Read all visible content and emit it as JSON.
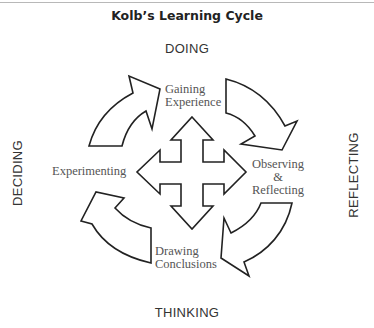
{
  "title": "Kolb’s Learning Cycle",
  "axes": {
    "top": "DOING",
    "right": "REFLECTING",
    "bottom": "THINKING",
    "left": "DECIDING"
  },
  "stages": [
    {
      "id": "gaining",
      "lines": [
        "Gaining",
        "Experience"
      ]
    },
    {
      "id": "observing",
      "lines": [
        "Observing",
        "&",
        "Reflecting"
      ]
    },
    {
      "id": "drawing",
      "lines": [
        "Drawing",
        "Conclusions"
      ]
    },
    {
      "id": "experimenting",
      "lines": [
        "Experimenting"
      ]
    }
  ],
  "center_icon": "four-way-arrow-icon",
  "cycle_arrows": [
    "curved-arrow-top-left",
    "curved-arrow-top-right",
    "curved-arrow-bottom-right",
    "curved-arrow-bottom-left"
  ],
  "colors": {
    "stroke": "#222222",
    "fill": "#ffffff",
    "label": "#555555",
    "title": "#222222"
  }
}
